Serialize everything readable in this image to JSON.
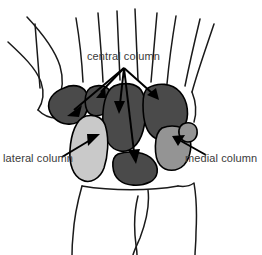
{
  "figure": {
    "background_color": "#ffffff",
    "outline_color": "#000000",
    "label_text_color": "#3a3a3a"
  },
  "labels": {
    "central": "central column",
    "lateral": "lateral column",
    "medial": "medial column"
  },
  "colors": {
    "central_column_fill": "#4a4a4a",
    "lateral_column_fill": "#c9c9c9",
    "medial_column_fill": "#949494",
    "bone_unfilled": "#ffffff",
    "stroke": "#000000"
  },
  "columns": [
    {
      "name": "central column",
      "fill": "#4a4a4a",
      "bones": [
        "trapezium",
        "trapezoid",
        "capitate",
        "hamate",
        "lunate"
      ],
      "arrow_count": 5
    },
    {
      "name": "lateral column",
      "fill": "#c9c9c9",
      "bones": [
        "scaphoid"
      ],
      "arrow_count": 1
    },
    {
      "name": "medial column",
      "fill": "#949494",
      "bones": [
        "triquetrum",
        "pisiform"
      ],
      "arrow_count": 1
    }
  ],
  "annotations": {
    "central_arrow_origin": "124,68",
    "central_arrow_targets": [
      "70,113",
      "102,96",
      "122,114",
      "155,100",
      "135,160"
    ],
    "lateral_arrow": "from 62,158 to 100,135",
    "medial_arrow": "from 205,155 to 173,137"
  },
  "structures": {
    "metacarpals": 5,
    "forearm_bones": [
      "radius",
      "ulna"
    ]
  }
}
